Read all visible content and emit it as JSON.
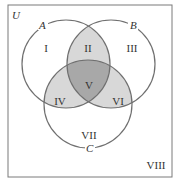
{
  "diagram": {
    "type": "venn-3-set",
    "universe_label": "U",
    "sets": [
      {
        "id": "A",
        "label": "A"
      },
      {
        "id": "B",
        "label": "B"
      },
      {
        "id": "C",
        "label": "C"
      }
    ],
    "regions": [
      {
        "id": "I",
        "label": "I",
        "description": "A only",
        "shade": "none"
      },
      {
        "id": "II",
        "label": "II",
        "description": "A and B, not C",
        "shade": "light"
      },
      {
        "id": "III",
        "label": "III",
        "description": "B only",
        "shade": "none"
      },
      {
        "id": "IV",
        "label": "IV",
        "description": "A and C, not B",
        "shade": "light"
      },
      {
        "id": "V",
        "label": "V",
        "description": "A and B and C",
        "shade": "dark"
      },
      {
        "id": "VI",
        "label": "VI",
        "description": "B and C, not A",
        "shade": "light"
      },
      {
        "id": "VII",
        "label": "VII",
        "description": "C only",
        "shade": "none"
      },
      {
        "id": "VIII",
        "label": "VIII",
        "description": "outside A, B and C",
        "shade": "none"
      }
    ],
    "colors": {
      "frame": "#7a7a7a",
      "circle_stroke": "#707070",
      "light_shade": "#d8d8d8",
      "dark_shade": "#a8a8a8",
      "text": "#333333"
    }
  }
}
